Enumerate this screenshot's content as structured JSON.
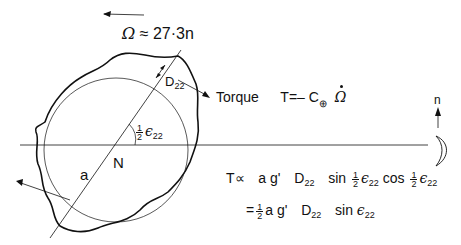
{
  "labels": {
    "omega_relation": {
      "symbol": "Ω",
      "relation": "≈",
      "value": "27·3n"
    },
    "deformation": {
      "symbol": "D",
      "subscript": "22"
    },
    "torque": {
      "word": "Torque",
      "lhs": "T",
      "equals": "=",
      "minus": "–",
      "C": "C",
      "subscript_symbol": "⊕",
      "rate_symbol": "Ω"
    },
    "angle": {
      "num": "1",
      "den": "2",
      "symbol": "ϵ",
      "subscript": "22"
    },
    "radius": "a",
    "center": "N",
    "moon_direction": "n",
    "proportional": {
      "lhs": "T",
      "rel": "∝",
      "terms": "a g'",
      "D": "D",
      "D_sub": "22",
      "sin": "sin",
      "half_num": "1",
      "half_den": "2",
      "eps": "ϵ",
      "eps_sub": "22",
      "cos": "cos"
    },
    "simplified": {
      "equals": "=",
      "half_num": "1",
      "half_den": "2",
      "terms": "a g'",
      "D": "D",
      "D_sub": "22",
      "sin": "sin",
      "eps": "ϵ",
      "eps_sub": "22"
    }
  },
  "colors": {
    "ink": "#111111",
    "background": "#ffffff"
  }
}
